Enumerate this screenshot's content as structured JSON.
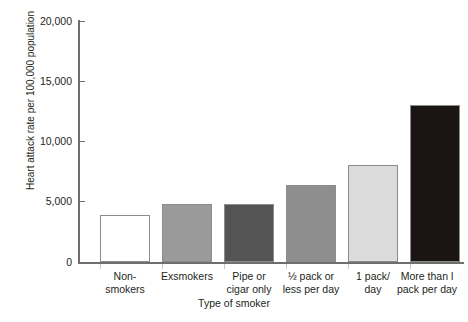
{
  "chart_data": {
    "type": "bar",
    "title": "",
    "xlabel": "Type of smoker",
    "ylabel": "Heart attack rate per 100,000 population",
    "categories": [
      "Non-\nsmokers",
      "Exsmokers",
      "Pipe or\ncigar only",
      "½ pack or\nless per day",
      "1 pack/\nday",
      "More than l\npack per day"
    ],
    "values": [
      3900,
      4800,
      4800,
      6350,
      8000,
      13000
    ],
    "bar_colors": [
      "#ffffff",
      "#9a9a9a",
      "#545454",
      "#8e8e8e",
      "#dcdcdc",
      "#1a1512"
    ],
    "bar_border_color": "#8c8c8c",
    "ylim": [
      0,
      20000
    ],
    "yticks": [
      0,
      5000,
      10000,
      15000,
      20000
    ],
    "ytick_labels": [
      "0",
      "5,000",
      "10,000",
      "15,000",
      "20,000"
    ],
    "grid": false,
    "legend": null
  },
  "axes": {
    "y_title": "Heart attack rate per 100,000 population",
    "x_title": "Type of smoker",
    "y_labels": [
      "20,000",
      "15,000",
      "10,000",
      "5,000",
      "0"
    ]
  },
  "x_categories": [
    {
      "line1": "Non-",
      "line2": "smokers"
    },
    {
      "line1": "Exsmokers",
      "line2": ""
    },
    {
      "line1": "Pipe or",
      "line2": "cigar only"
    },
    {
      "line1": "½ pack or",
      "line2": "less per day"
    },
    {
      "line1": "1 pack/",
      "line2": "day"
    },
    {
      "line1": "More than l",
      "line2": "pack per day"
    }
  ],
  "header": {
    "clipped_title": ""
  }
}
